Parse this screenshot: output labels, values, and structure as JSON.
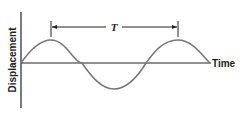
{
  "diagram": {
    "type": "sine-wave-period",
    "y_axis_label": "Displacement",
    "x_axis_label": "Time",
    "period_label": "T",
    "colors": {
      "wave": "#777777",
      "axis": "#222222",
      "text": "#222222"
    }
  }
}
